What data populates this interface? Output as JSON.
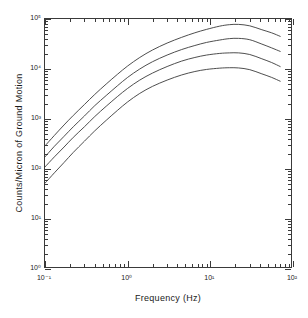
{
  "chart_data": {
    "type": "line",
    "title": "",
    "xlabel": "Frequency (Hz)",
    "ylabel": "Counts/Micron of Ground Motion",
    "xscale": "log",
    "yscale": "log",
    "xlim": [
      0.1,
      100
    ],
    "ylim": [
      1,
      100000
    ],
    "grid": false,
    "legend": "none",
    "x_tick_labels": [
      "10⁻¹",
      "10⁰",
      "10¹",
      "10²"
    ],
    "x_tick_values": [
      0.1,
      1,
      10,
      100
    ],
    "y_tick_labels": [
      "10⁰",
      "10¹",
      "10²",
      "10³",
      "10⁴",
      "10⁵"
    ],
    "y_tick_values": [
      1,
      10,
      100,
      1000,
      10000,
      100000
    ],
    "series": [
      {
        "name": "curve-1",
        "x": [
          0.1,
          0.13,
          0.17,
          0.22,
          0.3,
          0.4,
          0.55,
          0.75,
          1.0,
          1.4,
          2.0,
          3.0,
          4.5,
          6.5,
          9.0,
          13.0,
          17.0,
          22.0,
          30.0,
          42.0,
          55.0,
          70.0
        ],
        "y": [
          290,
          470,
          760,
          1180,
          1950,
          3100,
          5000,
          7800,
          11500,
          17000,
          24000,
          33000,
          43000,
          53000,
          62000,
          72000,
          77000,
          78000,
          73000,
          61000,
          53000,
          45000
        ]
      },
      {
        "name": "curve-2",
        "x": [
          0.1,
          0.13,
          0.17,
          0.22,
          0.3,
          0.4,
          0.55,
          0.75,
          1.0,
          1.4,
          2.0,
          3.0,
          4.5,
          6.5,
          9.0,
          13.0,
          17.0,
          22.0,
          30.0,
          42.0,
          55.0,
          70.0
        ],
        "y": [
          175,
          285,
          450,
          700,
          1150,
          1850,
          2950,
          4600,
          6800,
          10000,
          14000,
          19000,
          24500,
          29500,
          34000,
          38000,
          40500,
          41000,
          38500,
          31500,
          26500,
          22500
        ]
      },
      {
        "name": "curve-3",
        "x": [
          0.1,
          0.13,
          0.17,
          0.22,
          0.3,
          0.4,
          0.55,
          0.75,
          1.0,
          1.4,
          2.0,
          3.0,
          4.5,
          6.5,
          9.0,
          13.0,
          17.0,
          22.0,
          30.0,
          42.0,
          55.0,
          70.0
        ],
        "y": [
          110,
          175,
          275,
          430,
          700,
          1120,
          1800,
          2800,
          4100,
          6000,
          8300,
          11200,
          14400,
          17000,
          19000,
          20500,
          21000,
          21000,
          19500,
          16000,
          13500,
          11200
        ]
      },
      {
        "name": "curve-4",
        "x": [
          0.1,
          0.13,
          0.17,
          0.22,
          0.3,
          0.4,
          0.55,
          0.75,
          1.0,
          1.4,
          2.0,
          3.0,
          4.5,
          6.5,
          9.0,
          13.0,
          17.0,
          22.0,
          30.0,
          42.0,
          55.0,
          70.0
        ],
        "y": [
          52,
          84,
          135,
          215,
          360,
          580,
          940,
          1480,
          2200,
          3250,
          4500,
          6000,
          7600,
          8900,
          9800,
          10400,
          10600,
          10500,
          9700,
          8000,
          6800,
          5700
        ]
      }
    ]
  },
  "axis": {
    "x_title": "Frequency (Hz)",
    "y_title": "Counts/Micron of Ground Motion"
  },
  "style": {
    "line_color": "#3a3a3a",
    "frame_color": "#3a3a3a",
    "background": "#ffffff"
  }
}
